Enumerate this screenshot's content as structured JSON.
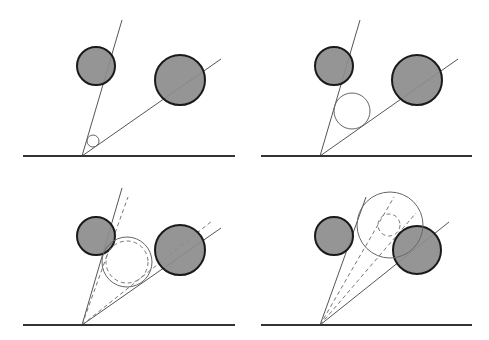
{
  "diagram": {
    "colors": {
      "background": "#ffffff",
      "obstacle_fill": "#8c8c8c",
      "obstacle_stroke": "#1a1a1a",
      "ray_stroke": "#555555",
      "baseline_stroke": "#333333",
      "probe_stroke": "#666666",
      "dashed_stroke": "#777777"
    },
    "panels": [
      {
        "id": "top-left",
        "baseline": {
          "x1": 23,
          "x2": 235,
          "y": 156
        },
        "apex": {
          "x": 82,
          "y": 156
        },
        "rays": [
          {
            "x2": 122,
            "y2": 20
          },
          {
            "x2": 221,
            "y2": 59
          }
        ],
        "dashed_rays": [],
        "obstacles": [
          {
            "cx": 96,
            "cy": 66,
            "r": 19
          },
          {
            "cx": 180,
            "cy": 80,
            "r": 25
          }
        ],
        "probe_circles": [
          {
            "cx": 93,
            "cy": 141,
            "r": 6,
            "dashed": false
          }
        ]
      },
      {
        "id": "top-right",
        "baseline": {
          "x1": 261,
          "x2": 472,
          "y": 156
        },
        "apex": {
          "x": 320,
          "y": 156
        },
        "rays": [
          {
            "x2": 360,
            "y2": 20
          },
          {
            "x2": 458,
            "y2": 59
          }
        ],
        "dashed_rays": [],
        "obstacles": [
          {
            "cx": 334,
            "cy": 66,
            "r": 19
          },
          {
            "cx": 417,
            "cy": 80,
            "r": 25
          }
        ],
        "probe_circles": [
          {
            "cx": 352,
            "cy": 111,
            "r": 18,
            "dashed": false
          }
        ]
      },
      {
        "id": "bottom-left",
        "baseline": {
          "x1": 23,
          "x2": 235,
          "y": 325
        },
        "apex": {
          "x": 82,
          "y": 325
        },
        "rays": [
          {
            "x2": 122,
            "y2": 188
          },
          {
            "x2": 221,
            "y2": 228
          }
        ],
        "dashed_rays": [
          {
            "x2": 128,
            "y2": 197
          },
          {
            "x2": 212,
            "y2": 221
          }
        ],
        "obstacles": [
          {
            "cx": 96,
            "cy": 236,
            "r": 19
          },
          {
            "cx": 180,
            "cy": 250,
            "r": 25
          }
        ],
        "probe_circles": [
          {
            "cx": 127,
            "cy": 262,
            "r": 25,
            "dashed": false
          },
          {
            "cx": 127,
            "cy": 262,
            "r": 21,
            "dashed": true
          }
        ]
      },
      {
        "id": "bottom-right",
        "baseline": {
          "x1": 261,
          "x2": 472,
          "y": 325
        },
        "apex": {
          "x": 320,
          "y": 325
        },
        "rays": [
          {
            "x2": 366,
            "y2": 197
          },
          {
            "x2": 449,
            "y2": 222
          }
        ],
        "dashed_rays": [
          {
            "x2": 394,
            "y2": 197
          },
          {
            "x2": 416,
            "y2": 213
          }
        ],
        "obstacles": [
          {
            "cx": 334,
            "cy": 236,
            "r": 19
          },
          {
            "cx": 417,
            "cy": 250,
            "r": 24
          }
        ],
        "probe_circles": [
          {
            "cx": 390,
            "cy": 225,
            "r": 33,
            "dashed": false
          },
          {
            "cx": 389,
            "cy": 225,
            "r": 11,
            "dashed": true
          }
        ]
      }
    ]
  }
}
